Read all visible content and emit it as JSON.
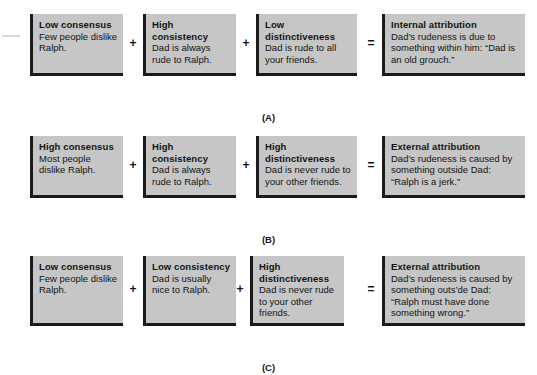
{
  "figure": {
    "background_color": "#ffffff",
    "box_fill_color": "#c6c6c6",
    "box_border_color": "#1a1a1a",
    "text_color": "#141414"
  },
  "operators": {
    "plus": "+",
    "equals": "="
  },
  "rows": [
    {
      "label": "(A)",
      "boxes": [
        {
          "heading": "Low consensus",
          "body": "Few people dislike Ralph."
        },
        {
          "heading": "High consistency",
          "body": "Dad is always rude to Ralph."
        },
        {
          "heading": "Low distinctiveness",
          "body": "Dad is rude to all your friends."
        },
        {
          "heading": "Internal attribution",
          "body": "Dad’s rudeness is due to something within him: “Dad is an old grouch.”"
        }
      ]
    },
    {
      "label": "(B)",
      "boxes": [
        {
          "heading": "High consensus",
          "body": "Most people dislike Ralph."
        },
        {
          "heading": "High consistency",
          "body": "Dad is always rude to Ralph."
        },
        {
          "heading": "High distinctiveness",
          "body": "Dad is never rude to your other friends."
        },
        {
          "heading": "External attribution",
          "body": "Dad’s rudeness is caused by something outside Dad: “Ralph is a jerk.”"
        }
      ]
    },
    {
      "label": "(C)",
      "boxes": [
        {
          "heading": "Low consensus",
          "body": "Few people dislike Ralph."
        },
        {
          "heading": "Low consistency",
          "body": "Dad is usually nice to Ralph."
        },
        {
          "heading": "High distinctiveness",
          "body": "Dad is never rude to your other friends."
        },
        {
          "heading": "External attribution",
          "body": "Dad’s rudeness is caused by something outs’de Dad: “Ralph must have done something wrong.”"
        }
      ]
    }
  ]
}
